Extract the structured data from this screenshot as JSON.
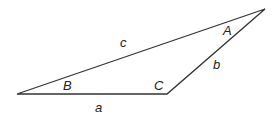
{
  "diagram": {
    "type": "triangle",
    "stroke_color": "#333333",
    "vertices": {
      "B": {
        "x": 17,
        "y": 94
      },
      "C": {
        "x": 167,
        "y": 94
      },
      "A": {
        "x": 265,
        "y": 9
      }
    },
    "angle_labels": {
      "A": "A",
      "B": "B",
      "C": "C"
    },
    "side_labels": {
      "a": "a",
      "b": "b",
      "c": "c"
    }
  }
}
